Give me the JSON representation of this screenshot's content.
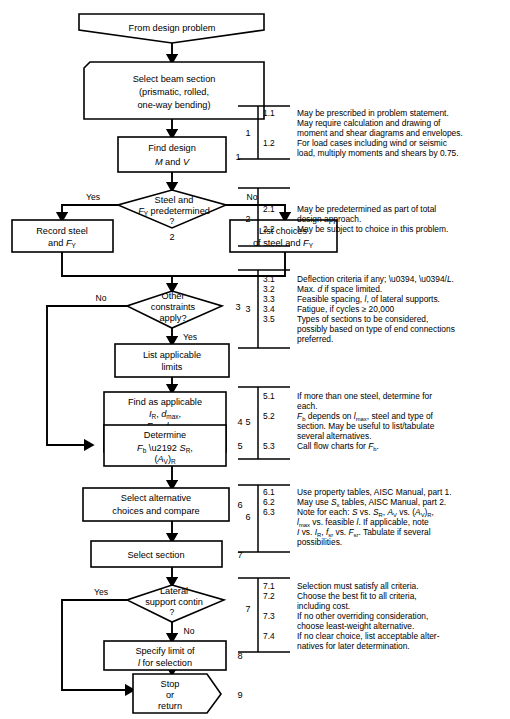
{
  "diagram": {
    "nodes": [
      {
        "id": "start",
        "label_lines": [
          "From design problem"
        ],
        "shape": "hexagon-start",
        "step": ""
      },
      {
        "id": "select_beam",
        "label_lines": [
          "Select beam section",
          "(prismatic, rolled,",
          "one-way bending)"
        ],
        "shape": "flag",
        "step": ""
      },
      {
        "id": "find_design",
        "label_lines": [
          "Find design",
          "M and V"
        ],
        "shape": "rect",
        "step": "1"
      },
      {
        "id": "steel_fy",
        "label_lines": [
          "Steel and",
          "F_Y predetermined",
          "?"
        ],
        "shape": "diamond",
        "step": "2"
      },
      {
        "id": "record_steel",
        "label_lines": [
          "Record steel",
          "and F_Y"
        ],
        "shape": "rect",
        "step": ""
      },
      {
        "id": "list_choices",
        "label_lines": [
          "List choices",
          "of steel and F_Y"
        ],
        "shape": "rect",
        "step": ""
      },
      {
        "id": "other_constraints",
        "label_lines": [
          "Other",
          "constraints",
          "apply?"
        ],
        "shape": "diamond",
        "step": "3"
      },
      {
        "id": "list_limits",
        "label_lines": [
          "List applicable",
          "limits"
        ],
        "shape": "rect",
        "step": ""
      },
      {
        "id": "find_applicable",
        "label_lines": [
          "Find as applicable",
          "I_R, d_max,",
          "F_SR, l_max,",
          "other limits"
        ],
        "shape": "rect",
        "step": "4"
      },
      {
        "id": "determine",
        "label_lines": [
          "Determine",
          "F_b → S_R,",
          "(A_V)_R"
        ],
        "shape": "rect",
        "step": "5"
      },
      {
        "id": "select_alt",
        "label_lines": [
          "Select alternative",
          "choices and compare"
        ],
        "shape": "rect",
        "step": "6"
      },
      {
        "id": "select_section",
        "label_lines": [
          "Select section"
        ],
        "shape": "rect",
        "step": "7"
      },
      {
        "id": "lateral_support",
        "label_lines": [
          "Lateral",
          "support contin",
          "?"
        ],
        "shape": "diamond",
        "step": ""
      },
      {
        "id": "specify_limit",
        "label_lines": [
          "Specify limit of",
          "l for selection"
        ],
        "shape": "rect",
        "step": "8"
      },
      {
        "id": "stop",
        "label_lines": [
          "Stop",
          "or",
          "return"
        ],
        "shape": "hexagon-end",
        "step": "9"
      }
    ],
    "edge_labels": {
      "steel_yes": "Yes",
      "steel_no": "No",
      "constraints_no": "No",
      "constraints_yes": "Yes",
      "lateral_yes": "Yes",
      "lateral_no": "No"
    }
  },
  "notes": [
    {
      "group": "1",
      "items": [
        "1.1",
        "1.2"
      ],
      "item_offsets": [
        0,
        3
      ],
      "lines": [
        "May be prescribed in problem statement.",
        "May require calculation and drawing of",
        "moment and shear diagrams and envelopes.",
        "For load cases including wind or seismic",
        "load, multiply moments and shears by 0.75."
      ]
    },
    {
      "group": "2",
      "items": [
        "2.1",
        "2.2"
      ],
      "item_offsets": [
        0,
        2
      ],
      "lines": [
        "May be predetermined as part of total",
        "design approach.",
        "May be subject to choice in this problem."
      ]
    },
    {
      "group": "3",
      "items": [
        "3.1",
        "3.2",
        "3.3",
        "3.4",
        "3.5"
      ],
      "item_offsets": [
        0,
        1,
        2,
        3,
        4
      ],
      "lines": [
        "Deflection criteria if any; Δ, Δ/L.",
        "Max. d if space limited.",
        "Feasible spacing, l, of lateral supports.",
        "Fatigue, if cycles ≥ 20,000",
        "Types of sections to be considered,",
        "possibly based on type of end connections",
        "preferred."
      ]
    },
    {
      "group": "5",
      "items": [
        "5.1",
        "5.2",
        "5.3"
      ],
      "item_offsets": [
        0,
        2,
        5
      ],
      "lines": [
        "If more than one steel, determine for",
        "each.",
        "F_b depends on l_max, steel and type of",
        "section. May be useful to list/tabulate",
        "several alternatives.",
        "Call flow charts for F_b."
      ]
    },
    {
      "group": "6",
      "items": [
        "6.1",
        "6.2",
        "6.3"
      ],
      "item_offsets": [
        0,
        1,
        2
      ],
      "lines": [
        "Use property tables, AISC Manual, part 1.",
        "May use S_x tables, AISC Manual, part 2.",
        "Note for each: S vs. S_R, A_V vs. (A_V)_R,",
        "l_max vs. feasible l. If applicable, note",
        "I vs. I_R, f_sr vs. F_sr. Tabulate if several",
        "possibilities."
      ]
    },
    {
      "group": "7",
      "items": [
        "7.1",
        "7.2",
        "7.3",
        "7.4"
      ],
      "item_offsets": [
        0,
        1,
        3,
        5
      ],
      "lines": [
        "Selection must satisfy all criteria.",
        "Choose the best fit to all criteria,",
        "including cost.",
        "If no other overriding consideration,",
        "choose least-weight alternative.",
        "If no clear choice, list acceptable alter-",
        "natives for later determination."
      ]
    }
  ],
  "colors": {
    "ink": "#000000",
    "paper": "#ffffff"
  }
}
